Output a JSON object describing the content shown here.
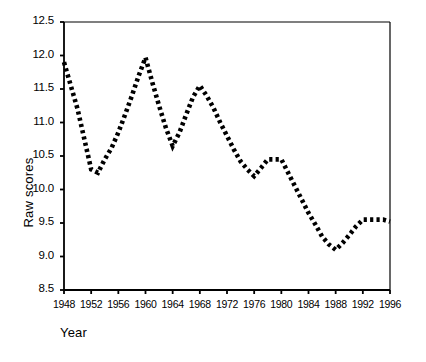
{
  "chart_data": {
    "type": "line",
    "title": "",
    "xlabel": "Year",
    "ylabel": "Raw scores",
    "xlim": [
      1948,
      1996
    ],
    "ylim": [
      8.5,
      12.5
    ],
    "grid": false,
    "legend": null,
    "line_style": "dotted",
    "line_color": "#000000",
    "frame": "box-top-right-with-left-and-bottom-axis",
    "xticks": [
      1948,
      1952,
      1956,
      1960,
      1964,
      1968,
      1972,
      1976,
      1980,
      1984,
      1988,
      1992,
      1996
    ],
    "xtick_labels": [
      "1948",
      "1952",
      "1956",
      "1960",
      "1964",
      "1968",
      "1972",
      "1976",
      "1980",
      "1984",
      "1988",
      "1992",
      "1996"
    ],
    "yticks": [
      8.5,
      9.0,
      9.5,
      10.0,
      10.5,
      11.0,
      11.5,
      12.0,
      12.5
    ],
    "ytick_labels": [
      "8.5",
      "9.0",
      "9.5",
      "10.0",
      "10.5",
      "11.0",
      "11.5",
      "12.0",
      "12.5"
    ],
    "x": [
      1948,
      1949,
      1950,
      1951,
      1952,
      1953,
      1954,
      1955,
      1956,
      1957,
      1958,
      1959,
      1960,
      1961,
      1962,
      1963,
      1964,
      1965,
      1966,
      1967,
      1968,
      1969,
      1970,
      1971,
      1972,
      1973,
      1974,
      1975,
      1976,
      1977,
      1978,
      1979,
      1980,
      1981,
      1982,
      1983,
      1984,
      1985,
      1986,
      1987,
      1988,
      1989,
      1990,
      1991,
      1992,
      1993,
      1994,
      1995,
      1996
    ],
    "values": [
      11.9,
      11.55,
      11.2,
      10.75,
      10.3,
      10.25,
      10.45,
      10.62,
      10.85,
      11.12,
      11.4,
      11.7,
      11.97,
      11.6,
      11.25,
      10.92,
      10.65,
      10.85,
      11.12,
      11.38,
      11.55,
      11.4,
      11.22,
      11.0,
      10.8,
      10.6,
      10.42,
      10.3,
      10.2,
      10.32,
      10.45,
      10.45,
      10.45,
      10.25,
      10.05,
      9.85,
      9.65,
      9.48,
      9.3,
      9.18,
      9.1,
      9.2,
      9.32,
      9.45,
      9.55,
      9.55,
      9.55,
      9.55,
      9.52
    ],
    "series": [
      {
        "name": "Raw scores",
        "values": [
          11.9,
          11.55,
          11.2,
          10.75,
          10.3,
          10.25,
          10.45,
          10.62,
          10.85,
          11.12,
          11.4,
          11.7,
          11.97,
          11.6,
          11.25,
          10.92,
          10.65,
          10.85,
          11.12,
          11.38,
          11.55,
          11.4,
          11.22,
          11.0,
          10.8,
          10.6,
          10.42,
          10.3,
          10.2,
          10.32,
          10.45,
          10.45,
          10.45,
          10.25,
          10.05,
          9.85,
          9.65,
          9.48,
          9.3,
          9.18,
          9.1,
          9.2,
          9.32,
          9.45,
          9.55,
          9.55,
          9.55,
          9.55,
          9.52
        ]
      }
    ],
    "annotations": []
  }
}
